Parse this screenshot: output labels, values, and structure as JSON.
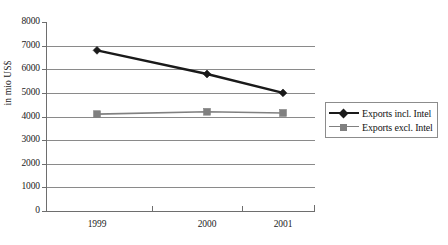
{
  "chart_data": {
    "type": "line",
    "title": "",
    "subtitle": "",
    "xlabel": "",
    "ylabel": "in mio US$",
    "categories": [
      "1999",
      "2000",
      "2001"
    ],
    "x": [
      1999,
      2000,
      2001
    ],
    "ylim": [
      0,
      8000
    ],
    "ytick_values": [
      0,
      1000,
      2000,
      3000,
      4000,
      5000,
      6000,
      7000,
      8000
    ],
    "ytick_labels": [
      "0",
      "1000",
      "2000",
      "3000",
      "4000",
      "5000",
      "6000",
      "7000",
      "8000"
    ],
    "grid": "horizontal",
    "gridlines_at": [
      1000,
      2000,
      3000,
      4000,
      5000,
      6000,
      7000
    ],
    "legend_position": "right-middle-outside",
    "series": [
      {
        "name": "Exports incl. Intel",
        "values": [
          6800,
          5800,
          5000
        ],
        "color": "#1a1a1a",
        "marker": "diamond",
        "line_width": 2.4
      },
      {
        "name": "Exports excl. Intel",
        "values": [
          4100,
          4200,
          4150
        ],
        "color": "#808080",
        "marker": "square",
        "line_width": 1.6
      }
    ]
  },
  "legend": {
    "entries": [
      {
        "label": "Exports incl. Intel",
        "marker": "diamond-marker-icon",
        "color": "#1a1a1a"
      },
      {
        "label": "Exports excl. Intel",
        "marker": "square-marker-icon",
        "color": "#808080"
      }
    ]
  },
  "axes": {
    "y_title": "in mio US$",
    "y_ticks": [
      "8000",
      "7000",
      "6000",
      "5000",
      "4000",
      "3000",
      "2000",
      "1000",
      "0"
    ],
    "x_ticks": [
      "1999",
      "2000",
      "2001"
    ]
  },
  "colors": {
    "series1": "#1a1a1a",
    "series2": "#808080",
    "gridline": "#8a8a8a",
    "axis": "#6e6e6e",
    "background": "#ffffff",
    "text": "#1a1a1a"
  }
}
